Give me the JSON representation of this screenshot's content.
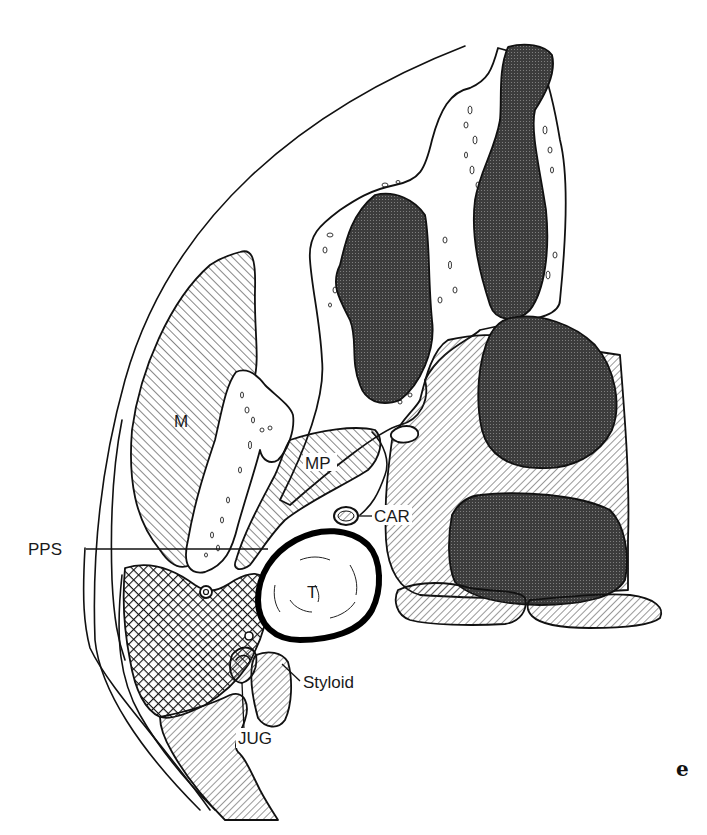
{
  "figure": {
    "panel_label": "e",
    "labels": {
      "masseter": "M",
      "medial_pterygoid": "MP",
      "parapharyngeal_space": "PPS",
      "carotid": "CAR",
      "tumor": "T",
      "styloid": "Styloid",
      "jugular": "JUG"
    },
    "colors": {
      "ink": "#111111",
      "background": "#ffffff",
      "dense_fill": "#4a4a4a"
    }
  }
}
